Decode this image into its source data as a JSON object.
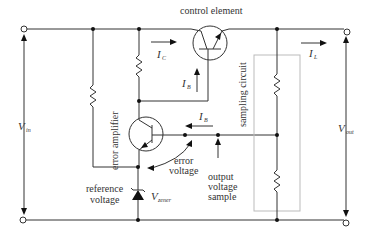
{
  "diagram": {
    "labels": {
      "control_element": "control element",
      "error_amplifier": "error amplifier",
      "sampling_circuit": "sampling circuit",
      "reference_voltage_line1": "reference",
      "reference_voltage_line2": "voltage",
      "error_voltage_line1": "error",
      "error_voltage_line2": "voltage",
      "output_sample_line1": "output",
      "output_sample_line2": "voltage",
      "output_sample_line3": "sample"
    },
    "symbols": {
      "vin": "V",
      "vin_sub": "in",
      "vout": "V",
      "vout_sub": "out",
      "ic": "I",
      "ic_sub": "C",
      "il": "I",
      "il_sub": "L",
      "ib1": "I",
      "ib1_sub": "B",
      "ib2": "I",
      "ib2_sub": "B",
      "vzener": "V",
      "vzener_sub": "zener"
    },
    "components": [
      "npn-transistor-control",
      "npn-transistor-error-amp",
      "zener-diode",
      "resistor-left",
      "resistor-collector",
      "resistor-sample-top",
      "resistor-sample-bottom"
    ]
  }
}
